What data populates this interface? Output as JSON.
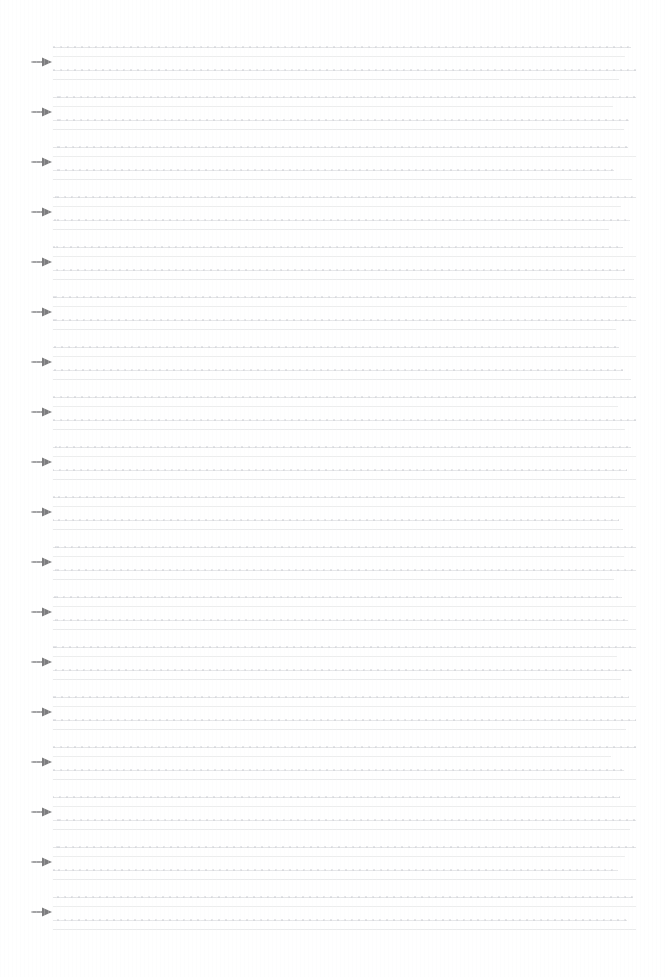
{
  "page": {
    "kind": "scanned-document-page",
    "width": 668,
    "height": 977,
    "background_color": "#ffffff",
    "margins": {
      "left_margin_px": 31,
      "text_left_px": 53,
      "text_right_px": 636,
      "top_px": 44,
      "bottom_px": 932
    },
    "visible_text": "",
    "note_label": "",
    "blocks_count_label": "18",
    "lines_per_block_label": "4",
    "block_pitch_label": "50"
  },
  "marker": {
    "icon_name": "right-arrow-marker",
    "glyph": "→",
    "color": "#7c7c7e",
    "count": 18
  },
  "ruled_lines": {
    "colors": {
      "line_1": "#e3e4e6",
      "line_2": "#eceded",
      "line_3": "#e6e7e9",
      "line_4": "#e9eaeb",
      "speckle": "#c8cad0"
    },
    "left_px": 53,
    "width_px": 583
  },
  "blocks": [
    {
      "id": 1,
      "top": 44,
      "marker_top": 55,
      "line_widths": [
        578,
        572,
        583,
        566
      ]
    },
    {
      "id": 2,
      "top": 94,
      "marker_top": 105,
      "line_widths": [
        583,
        560,
        576,
        571
      ]
    },
    {
      "id": 3,
      "top": 144,
      "marker_top": 155,
      "line_widths": [
        575,
        583,
        561,
        579
      ]
    },
    {
      "id": 4,
      "top": 194,
      "marker_top": 205,
      "line_widths": [
        583,
        568,
        577,
        556
      ]
    },
    {
      "id": 5,
      "top": 244,
      "marker_top": 255,
      "line_widths": [
        570,
        583,
        572,
        581
      ]
    },
    {
      "id": 6,
      "top": 294,
      "marker_top": 305,
      "line_widths": [
        583,
        574,
        583,
        563
      ]
    },
    {
      "id": 7,
      "top": 344,
      "marker_top": 355,
      "line_widths": [
        566,
        583,
        570,
        578
      ]
    },
    {
      "id": 8,
      "top": 394,
      "marker_top": 405,
      "line_widths": [
        583,
        565,
        583,
        572
      ]
    },
    {
      "id": 9,
      "top": 444,
      "marker_top": 455,
      "line_widths": [
        578,
        583,
        574,
        583
      ]
    },
    {
      "id": 10,
      "top": 494,
      "marker_top": 505,
      "line_widths": [
        572,
        583,
        566,
        570
      ]
    },
    {
      "id": 11,
      "top": 544,
      "marker_top": 555,
      "line_widths": [
        583,
        571,
        583,
        561
      ]
    },
    {
      "id": 12,
      "top": 594,
      "marker_top": 605,
      "line_widths": [
        569,
        583,
        575,
        583
      ]
    },
    {
      "id": 13,
      "top": 644,
      "marker_top": 655,
      "line_widths": [
        583,
        564,
        579,
        568
      ]
    },
    {
      "id": 14,
      "top": 694,
      "marker_top": 705,
      "line_widths": [
        576,
        583,
        583,
        573
      ]
    },
    {
      "id": 15,
      "top": 744,
      "marker_top": 755,
      "line_widths": [
        583,
        558,
        571,
        583
      ]
    },
    {
      "id": 16,
      "top": 794,
      "marker_top": 805,
      "line_widths": [
        567,
        583,
        583,
        577
      ]
    },
    {
      "id": 17,
      "top": 844,
      "marker_top": 855,
      "line_widths": [
        583,
        572,
        565,
        583
      ]
    },
    {
      "id": 18,
      "top": 894,
      "marker_top": 905,
      "line_widths": [
        580,
        583,
        574,
        583
      ]
    }
  ]
}
